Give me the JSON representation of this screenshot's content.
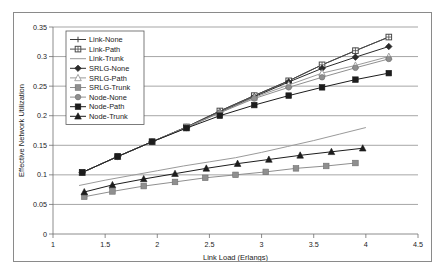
{
  "chart_data": {
    "type": "line",
    "title": "",
    "xlabel": "Link Load (Erlangs)",
    "ylabel": "Effective Network Utilization",
    "xlim": [
      1,
      4.5
    ],
    "ylim": [
      0,
      0.35
    ],
    "xticks": [
      "1",
      "1.5",
      "2",
      "2.5",
      "3",
      "3.5",
      "4",
      "4.5"
    ],
    "xtick_values": [
      1,
      1.5,
      2,
      2.5,
      3,
      3.5,
      4,
      4.5
    ],
    "yticks": [
      "0",
      "0.05",
      "0.1",
      "0.15",
      "0.2",
      "0.25",
      "0.3",
      "0.35"
    ],
    "ytick_values": [
      0,
      0.05,
      0.1,
      0.15,
      0.2,
      0.25,
      0.3,
      0.35
    ],
    "grid": "horizontal",
    "legend_position": "top-left-inside",
    "series": [
      {
        "name": "Link-None",
        "marker": "plus",
        "color": "#3d3d3d",
        "x": [
          1.28,
          1.62,
          1.95,
          2.28,
          2.6,
          2.93,
          3.26,
          3.58,
          3.9,
          4.22
        ],
        "y": [
          0.104,
          0.131,
          0.156,
          0.181,
          0.208,
          0.234,
          0.259,
          0.286,
          0.31,
          0.333
        ]
      },
      {
        "name": "Link-Path",
        "marker": "square-outline",
        "color": "#4a4a4a",
        "x": [
          1.28,
          1.62,
          1.95,
          2.28,
          2.6,
          2.93,
          3.26,
          3.58,
          3.9,
          4.22
        ],
        "y": [
          0.104,
          0.131,
          0.156,
          0.181,
          0.208,
          0.234,
          0.259,
          0.286,
          0.31,
          0.333
        ]
      },
      {
        "name": "Link-Trunk",
        "marker": "none",
        "color": "#9a9a9a",
        "x": [
          1.25,
          1.5,
          1.75,
          2.0,
          2.25,
          2.5,
          2.75,
          3.0,
          3.25,
          3.5,
          3.75,
          4.0
        ],
        "y": [
          0.082,
          0.091,
          0.099,
          0.107,
          0.115,
          0.122,
          0.129,
          0.138,
          0.148,
          0.158,
          0.169,
          0.18
        ]
      },
      {
        "name": "SRLG-None",
        "marker": "diamond",
        "color": "#2b2b2b",
        "x": [
          1.28,
          1.62,
          1.95,
          2.28,
          2.6,
          2.93,
          3.26,
          3.58,
          3.9,
          4.22
        ],
        "y": [
          0.104,
          0.131,
          0.156,
          0.18,
          0.206,
          0.232,
          0.257,
          0.28,
          0.299,
          0.317
        ]
      },
      {
        "name": "SRLG-Path",
        "marker": "triangle-outline",
        "color": "#9a9a9a",
        "x": [
          1.28,
          1.62,
          1.95,
          2.28,
          2.6,
          2.93,
          3.26,
          3.58,
          3.9,
          4.22
        ],
        "y": [
          0.104,
          0.131,
          0.156,
          0.18,
          0.205,
          0.231,
          0.252,
          0.272,
          0.285,
          0.3
        ]
      },
      {
        "name": "SRLG-Trunk",
        "marker": "square-gray",
        "color": "#8f8f8f",
        "x": [
          1.3,
          1.57,
          1.87,
          2.17,
          2.46,
          2.75,
          3.04,
          3.33,
          3.62,
          3.9
        ],
        "y": [
          0.063,
          0.072,
          0.081,
          0.088,
          0.095,
          0.1,
          0.105,
          0.111,
          0.115,
          0.12
        ]
      },
      {
        "name": "Node-None",
        "marker": "circle-gray",
        "color": "#8f8f8f",
        "x": [
          1.28,
          1.62,
          1.95,
          2.28,
          2.6,
          2.93,
          3.26,
          3.58,
          3.9,
          4.22
        ],
        "y": [
          0.104,
          0.131,
          0.156,
          0.18,
          0.205,
          0.229,
          0.248,
          0.265,
          0.281,
          0.296
        ]
      },
      {
        "name": "Node-Path",
        "marker": "square-filled",
        "color": "#1c1c1c",
        "x": [
          1.28,
          1.62,
          1.95,
          2.28,
          2.6,
          2.93,
          3.26,
          3.58,
          3.9,
          4.22
        ],
        "y": [
          0.104,
          0.131,
          0.156,
          0.179,
          0.2,
          0.218,
          0.234,
          0.248,
          0.261,
          0.272
        ]
      },
      {
        "name": "Node-Trunk",
        "marker": "triangle-filled",
        "color": "#1c1c1c",
        "x": [
          1.3,
          1.57,
          1.87,
          2.17,
          2.47,
          2.77,
          3.07,
          3.37,
          3.67,
          3.97
        ],
        "y": [
          0.071,
          0.083,
          0.093,
          0.102,
          0.111,
          0.119,
          0.126,
          0.133,
          0.139,
          0.145
        ]
      }
    ]
  },
  "legend": {
    "items": [
      {
        "label": "Link-None"
      },
      {
        "label": "Link-Path"
      },
      {
        "label": "Link-Trunk"
      },
      {
        "label": "SRLG-None"
      },
      {
        "label": "SRLG-Path"
      },
      {
        "label": "SRLG-Trunk"
      },
      {
        "label": "Node-None"
      },
      {
        "label": "Node-Path"
      },
      {
        "label": "Node-Trunk"
      }
    ]
  }
}
